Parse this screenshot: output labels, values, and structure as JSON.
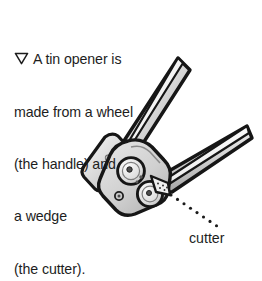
{
  "page": {
    "background_color": "#ffffff",
    "width": 262,
    "height": 254
  },
  "caption": {
    "bullet_icon": "triangle-down-icon",
    "lines": [
      "A tin opener is",
      "made from a wheel",
      "(the handle) and",
      "a wedge",
      "(the cutter)."
    ],
    "full_text": "A tin opener is made from a wheel (the handle) and a wedge (the cutter).",
    "text_color": "#1d1d1d"
  },
  "illustration": {
    "name": "tin-opener-illustration",
    "alt": "Line drawing of a tin opener with two handles, a wheel and a cutter wedge",
    "parts": [
      {
        "name": "upper-handle",
        "label": "handle"
      },
      {
        "name": "lower-handle",
        "label": "handle"
      },
      {
        "name": "left-handle-plate",
        "label": "handle plate"
      },
      {
        "name": "wheel-upper",
        "label": "wheel"
      },
      {
        "name": "wheel-lower",
        "label": "wheel"
      },
      {
        "name": "cutter-wedge",
        "label": "cutter"
      }
    ],
    "colors": {
      "outline": "#1a1a1a",
      "light_metal": "#f2f2f2",
      "mid_metal": "#cfcfcf",
      "dark_metal": "#9a9a9a",
      "body_fill": "#d8d8d8",
      "highlight": "#ffffff"
    }
  },
  "callout": {
    "label": "cutter",
    "leader": "dotted-leader-line",
    "leader_dots": 8,
    "text_color": "#1d1d1d"
  }
}
